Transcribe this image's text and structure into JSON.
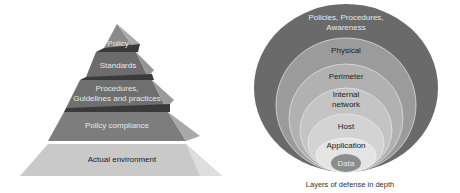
{
  "pyramid": {
    "levels": [
      {
        "label": "Policy",
        "color": "#8a8a8a"
      },
      {
        "label": "Standards",
        "color": "#6e6e6e"
      },
      {
        "label_line1": "Procedures,",
        "label_line2": "Guidelines and practices",
        "color": "#707070"
      },
      {
        "label": "Policy compliance",
        "color": "#7f7f7f"
      },
      {
        "label": "Actual environment",
        "color": "#c8c8c8"
      }
    ]
  },
  "layers": {
    "rings": [
      {
        "label_line1": "Policies, Procedures,",
        "label_line2": "Awareness",
        "color": "#6a6a6a"
      },
      {
        "label": "Physical",
        "color": "#9a9a9a"
      },
      {
        "label": "Perimeter",
        "color": "#b0b0b0"
      },
      {
        "label_line1": "Internal",
        "label_line2": "network",
        "color": "#c4c4c4"
      },
      {
        "label": "Host",
        "color": "#d2d2d2"
      },
      {
        "label": "Application",
        "color": "#e2e2e2"
      },
      {
        "label": "Data",
        "color": "#8c8c8c"
      }
    ],
    "caption": "Layers of defense in depth"
  }
}
